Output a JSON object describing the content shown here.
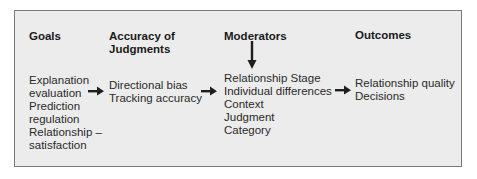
{
  "headers": {
    "goals": "Goals",
    "accuracy_line1": "Accuracy of",
    "accuracy_line2": "Judgments",
    "moderators": "Moderators",
    "outcomes": "Outcomes"
  },
  "goals": [
    "Explanation",
    "evaluation",
    "Prediction",
    "regulation",
    "Relationship –",
    "satisfaction"
  ],
  "accuracy": [
    "Directional bias",
    "Tracking accuracy"
  ],
  "moderators": [
    "Relationship Stage",
    "Individual differences",
    "Context",
    "Judgment",
    "Category"
  ],
  "outcomes": [
    "Relationship quality",
    "Decisions"
  ],
  "arrows": [
    "right-arrow",
    "right-arrow",
    "right-arrow",
    "down-arrow"
  ],
  "colors": {
    "background": "#ececec",
    "border": "#7a7a7a",
    "text": "#1e1e1e"
  }
}
